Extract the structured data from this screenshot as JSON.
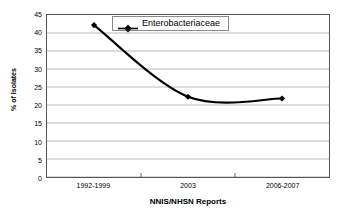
{
  "chart_data": {
    "type": "line",
    "title": "",
    "xlabel": "NNIS/NHSN Reports",
    "ylabel": "% of Isolates",
    "categories": [
      "1992-1999",
      "2003",
      "2006-2007"
    ],
    "series": [
      {
        "name": "Enterobacteriaceae",
        "values": [
          42.2,
          22.3,
          21.8
        ],
        "marker": "diamond",
        "color": "#000000",
        "smooth": true
      }
    ],
    "ylim": [
      0,
      45
    ],
    "ytick_step": 5,
    "yticks": [
      45,
      40,
      35,
      30,
      25,
      20,
      15,
      10,
      5,
      0
    ],
    "grid": "horizontal",
    "legend_position": "upper-right-inside",
    "legend_entries": [
      "Enterobacteriaceae"
    ],
    "plot_border": true,
    "background": "#ffffff",
    "gridline_color": "#a6a6a6",
    "axis_color": "#555555"
  }
}
